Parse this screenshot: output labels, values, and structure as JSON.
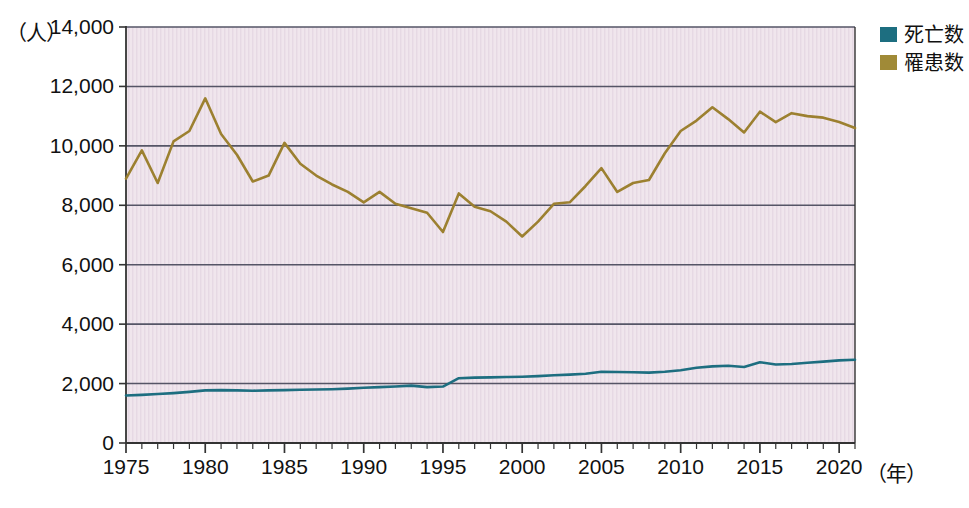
{
  "axes": {
    "y_unit_label": "（人）",
    "x_unit_label": "（年）",
    "y_ticks": [
      "0",
      "2,000",
      "4,000",
      "6,000",
      "8,000",
      "10,000",
      "12,000",
      "14,000"
    ],
    "x_ticks": [
      "1975",
      "1980",
      "1985",
      "1990",
      "1995",
      "2000",
      "2005",
      "2010",
      "2015",
      "2020"
    ]
  },
  "legend": {
    "position": "top-right",
    "items": [
      {
        "label": "死亡数",
        "color": "#1d6e80"
      },
      {
        "label": "罹患数",
        "color": "#a08a37"
      }
    ]
  },
  "colors": {
    "plot_background": "#f0e6ed",
    "gridline": "#555566",
    "axis": "#333333",
    "deaths_line": "#1d6e80",
    "incidence_line": "#9c8030",
    "page_background": "#ffffff"
  },
  "chart_data": {
    "type": "line",
    "title": "",
    "xlabel": "（年）",
    "ylabel": "（人）",
    "xlim": [
      1975,
      2021
    ],
    "ylim": [
      0,
      14000
    ],
    "grid": true,
    "legend_position": "top-right",
    "x": [
      1975,
      1976,
      1977,
      1978,
      1979,
      1980,
      1981,
      1982,
      1983,
      1984,
      1985,
      1986,
      1987,
      1988,
      1989,
      1990,
      1991,
      1992,
      1993,
      1994,
      1995,
      1996,
      1997,
      1998,
      1999,
      2000,
      2001,
      2002,
      2003,
      2004,
      2005,
      2006,
      2007,
      2008,
      2009,
      2010,
      2011,
      2012,
      2013,
      2014,
      2015,
      2016,
      2017,
      2018,
      2019,
      2020,
      2021
    ],
    "series": [
      {
        "name": "罹患数",
        "color": "#9c8030",
        "values": [
          8900,
          9850,
          8750,
          10150,
          10500,
          11600,
          10400,
          9700,
          8800,
          9000,
          10100,
          9400,
          9000,
          8700,
          8450,
          8100,
          8450,
          8050,
          7900,
          7750,
          7100,
          8400,
          7950,
          7800,
          7450,
          6950,
          7450,
          8050,
          8100,
          8650,
          9250,
          8450,
          8750,
          8850,
          9750,
          10500,
          10850,
          11300,
          10900,
          10450,
          11150,
          10800,
          11100,
          11000,
          10950,
          10800,
          10600
        ]
      },
      {
        "name": "死亡数",
        "color": "#1d6e80",
        "values": [
          1600,
          1620,
          1650,
          1680,
          1720,
          1770,
          1780,
          1770,
          1760,
          1770,
          1780,
          1790,
          1800,
          1810,
          1830,
          1860,
          1880,
          1900,
          1930,
          1880,
          1900,
          2180,
          2200,
          2210,
          2220,
          2230,
          2250,
          2280,
          2300,
          2330,
          2400,
          2390,
          2380,
          2370,
          2400,
          2450,
          2530,
          2580,
          2600,
          2560,
          2720,
          2640,
          2660,
          2700,
          2740,
          2780,
          2800
        ]
      }
    ]
  }
}
